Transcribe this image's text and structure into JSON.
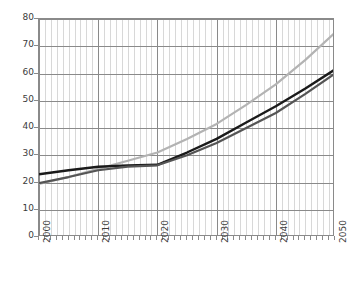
{
  "chart_data": {
    "type": "line",
    "title": "",
    "subtitle": "",
    "xlabel": "",
    "ylabel": "",
    "xlim": [
      2000,
      2050
    ],
    "ylim": [
      0,
      80
    ],
    "grid": true,
    "legend": "none",
    "x_tick_labels": [
      "2000",
      "2010",
      "2020",
      "2030",
      "2040",
      "2050"
    ],
    "x_tick_values": [
      2000,
      2010,
      2020,
      2030,
      2040,
      2050
    ],
    "y_tick_labels": [
      "0",
      "10",
      "20",
      "30",
      "40",
      "50",
      "60",
      "70",
      "80"
    ],
    "y_tick_values": [
      0,
      10,
      20,
      30,
      40,
      50,
      60,
      70,
      80
    ],
    "x_minor_tick_interval": 1,
    "x": [
      2000,
      2005,
      2010,
      2015,
      2020,
      2025,
      2030,
      2035,
      2040,
      2045,
      2050
    ],
    "series": [
      {
        "name": "series-light-gray",
        "color": "#b3b3b3",
        "width": 2.2,
        "values": [
          19.5,
          22.0,
          25.0,
          28.0,
          31.0,
          36.0,
          41.5,
          48.5,
          56.0,
          65.0,
          75.0
        ]
      },
      {
        "name": "series-black",
        "color": "#1a1a1a",
        "width": 2.4,
        "values": [
          23.0,
          24.5,
          25.8,
          26.3,
          26.5,
          31.0,
          36.0,
          42.0,
          48.0,
          54.5,
          61.5
        ]
      },
      {
        "name": "series-dark-gray",
        "color": "#555555",
        "width": 2.2,
        "values": [
          19.8,
          22.0,
          24.5,
          25.8,
          26.3,
          30.0,
          34.5,
          40.0,
          45.5,
          52.5,
          60.0
        ]
      }
    ]
  },
  "colors": {
    "background": "#ffffff",
    "axis": "#8a8a8a",
    "minor_grid": "#d8d8d8",
    "tick_text": "#3b3b3b"
  }
}
